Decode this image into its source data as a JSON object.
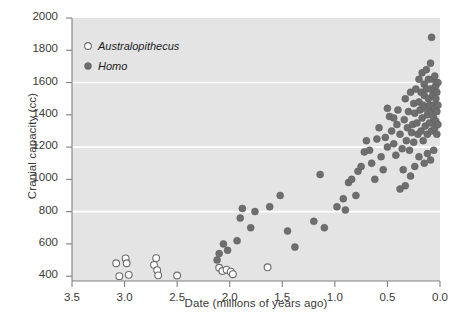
{
  "chart_data": {
    "type": "scatter",
    "title": "",
    "xlabel": "Date (millions of years ago)",
    "ylabel": "Cranial capacity (cc)",
    "xlim": [
      3.5,
      0.0
    ],
    "ylim": [
      370,
      2000
    ],
    "x_inverted": true,
    "xticks": [
      "3.5",
      "3.0",
      "2.5",
      "2.0",
      "1.5",
      "1.0",
      "0.5",
      "0.0"
    ],
    "xtick_values": [
      3.5,
      3.0,
      2.5,
      2.0,
      1.5,
      1.0,
      0.5,
      0.0
    ],
    "yticks": [
      "400",
      "600",
      "800",
      "1000",
      "1200",
      "1400",
      "1600",
      "1800",
      "2000"
    ],
    "ytick_values": [
      400,
      600,
      800,
      1000,
      1200,
      1400,
      1600,
      1800,
      2000
    ],
    "grid": true,
    "gridlines_y": [
      800,
      1200,
      1600
    ],
    "grid_color": "#ffffff",
    "plot_bg_color": "#e4e4e4",
    "page_bg_color": "#ffffff",
    "axis_color": "#808080",
    "legend_position": "top-left-inside",
    "series": [
      {
        "name": "Australopithecus",
        "marker": "open-circle",
        "color": "#ffffff",
        "edge_color": "#6b6b6b",
        "points": [
          [
            3.08,
            480
          ],
          [
            3.05,
            400
          ],
          [
            2.99,
            510
          ],
          [
            2.98,
            480
          ],
          [
            2.96,
            408
          ],
          [
            2.72,
            470
          ],
          [
            2.7,
            512
          ],
          [
            2.69,
            437
          ],
          [
            2.68,
            405
          ],
          [
            2.5,
            404
          ],
          [
            2.1,
            452
          ],
          [
            2.07,
            432
          ],
          [
            2.03,
            440
          ],
          [
            1.99,
            428
          ],
          [
            1.97,
            412
          ],
          [
            1.64,
            455
          ]
        ]
      },
      {
        "name": "Homo",
        "marker": "filled-circle",
        "color": "#6e6e6e",
        "edge_color": "#5a5a5a",
        "points": [
          [
            2.12,
            500
          ],
          [
            2.1,
            540
          ],
          [
            2.06,
            600
          ],
          [
            2.02,
            560
          ],
          [
            1.93,
            620
          ],
          [
            1.9,
            760
          ],
          [
            1.88,
            820
          ],
          [
            1.8,
            700
          ],
          [
            1.76,
            800
          ],
          [
            1.62,
            830
          ],
          [
            1.52,
            900
          ],
          [
            1.45,
            680
          ],
          [
            1.38,
            580
          ],
          [
            1.2,
            740
          ],
          [
            1.14,
            1030
          ],
          [
            1.1,
            700
          ],
          [
            0.98,
            830
          ],
          [
            0.92,
            880
          ],
          [
            0.9,
            810
          ],
          [
            0.87,
            980
          ],
          [
            0.84,
            1000
          ],
          [
            0.8,
            900
          ],
          [
            0.78,
            1050
          ],
          [
            0.75,
            1080
          ],
          [
            0.72,
            1170
          ],
          [
            0.7,
            1240
          ],
          [
            0.67,
            1180
          ],
          [
            0.65,
            1100
          ],
          [
            0.62,
            1000
          ],
          [
            0.6,
            1250
          ],
          [
            0.58,
            1320
          ],
          [
            0.56,
            1140
          ],
          [
            0.54,
            1060
          ],
          [
            0.52,
            1260
          ],
          [
            0.5,
            1200
          ],
          [
            0.48,
            1390
          ],
          [
            0.46,
            1300
          ],
          [
            0.44,
            1220
          ],
          [
            0.42,
            1150
          ],
          [
            0.41,
            1340
          ],
          [
            0.4,
            1430
          ],
          [
            0.38,
            1280
          ],
          [
            0.36,
            1190
          ],
          [
            0.35,
            1060
          ],
          [
            0.34,
            1370
          ],
          [
            0.33,
            1500
          ],
          [
            0.32,
            1240
          ],
          [
            0.31,
            1320
          ],
          [
            0.3,
            1420
          ],
          [
            0.29,
            1180
          ],
          [
            0.28,
            1540
          ],
          [
            0.27,
            1290
          ],
          [
            0.26,
            1340
          ],
          [
            0.25,
            1470
          ],
          [
            0.25,
            1230
          ],
          [
            0.24,
            1410
          ],
          [
            0.23,
            1560
          ],
          [
            0.22,
            1350
          ],
          [
            0.21,
            1280
          ],
          [
            0.2,
            1480
          ],
          [
            0.2,
            1620
          ],
          [
            0.19,
            1430
          ],
          [
            0.18,
            1540
          ],
          [
            0.18,
            1300
          ],
          [
            0.17,
            1380
          ],
          [
            0.17,
            1660
          ],
          [
            0.16,
            1460
          ],
          [
            0.16,
            1240
          ],
          [
            0.15,
            1520
          ],
          [
            0.15,
            1590
          ],
          [
            0.14,
            1330
          ],
          [
            0.14,
            1440
          ],
          [
            0.13,
            1560
          ],
          [
            0.13,
            1680
          ],
          [
            0.12,
            1400
          ],
          [
            0.12,
            1280
          ],
          [
            0.11,
            1500
          ],
          [
            0.11,
            1620
          ],
          [
            0.1,
            1350
          ],
          [
            0.1,
            1460
          ],
          [
            0.09,
            1560
          ],
          [
            0.09,
            1720
          ],
          [
            0.08,
            1420
          ],
          [
            0.08,
            1300
          ],
          [
            0.08,
            1880
          ],
          [
            0.07,
            1520
          ],
          [
            0.07,
            1620
          ],
          [
            0.06,
            1380
          ],
          [
            0.06,
            1460
          ],
          [
            0.06,
            1560
          ],
          [
            0.05,
            1320
          ],
          [
            0.05,
            1440
          ],
          [
            0.05,
            1640
          ],
          [
            0.04,
            1500
          ],
          [
            0.04,
            1360
          ],
          [
            0.04,
            1580
          ],
          [
            0.03,
            1420
          ],
          [
            0.03,
            1540
          ],
          [
            0.03,
            1280
          ],
          [
            0.02,
            1460
          ],
          [
            0.02,
            1600
          ],
          [
            0.02,
            1340
          ],
          [
            0.06,
            1180
          ],
          [
            0.09,
            1120
          ],
          [
            0.12,
            1160
          ],
          [
            0.15,
            1100
          ],
          [
            0.2,
            1140
          ],
          [
            0.24,
            1080
          ],
          [
            0.28,
            1020
          ],
          [
            0.33,
            960
          ],
          [
            0.38,
            940
          ],
          [
            0.44,
            1380
          ],
          [
            0.5,
            1440
          ]
        ]
      }
    ]
  },
  "legend": {
    "items": [
      {
        "label": "Australopithecus",
        "marker": "open-circle"
      },
      {
        "label": "Homo",
        "marker": "filled-circle"
      }
    ]
  }
}
